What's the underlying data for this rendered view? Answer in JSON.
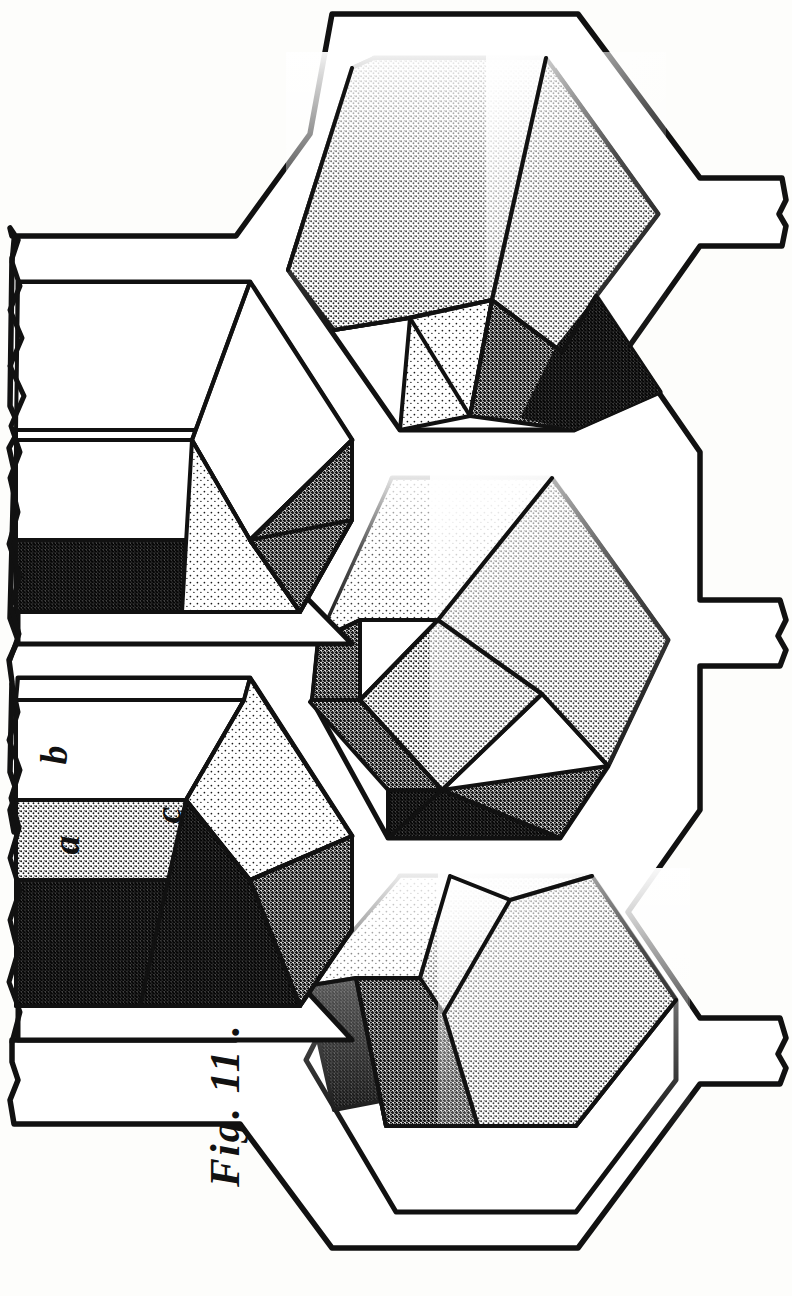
{
  "figure": {
    "caption": "Fig. 11 .",
    "plate_width": 792,
    "plate_height": 1296,
    "background_color": "#fdfdfb",
    "ink_color": "#111111"
  },
  "labels": [
    {
      "id": "a",
      "text": "a",
      "x": 56,
      "y": 826,
      "description": "lower-left cell wall, shaded band"
    },
    {
      "id": "b",
      "text": "b",
      "x": 44,
      "y": 736,
      "description": "lower-left cell wall, upper blank band"
    },
    {
      "id": "c",
      "text": "c",
      "x": 160,
      "y": 796,
      "description": "lower-left cell rhombic base facet"
    }
  ],
  "cells": [
    {
      "id": "cell-top-right",
      "name": "upper right hexagonal cell",
      "shading": "stippled",
      "visible_facets": 3
    },
    {
      "id": "cell-middle-right",
      "name": "middle right hexagonal cell",
      "shading": "stippled",
      "visible_facets": 3
    },
    {
      "id": "cell-bottom-right",
      "name": "lower right hexagonal cell",
      "shading": "stippled",
      "visible_facets": 3
    },
    {
      "id": "cell-upper-left",
      "name": "upper left sectioned cell",
      "shading": "part-stippled",
      "visible_facets": 3
    },
    {
      "id": "cell-lower-left",
      "name": "lower left sectioned cell",
      "shading": "part-stippled",
      "visible_facets": 3
    }
  ],
  "shading_levels": {
    "light": "#e9e9e4",
    "medium": "#b9b9b0",
    "dark": "#6e6e63",
    "darkest": "#3a3a33"
  },
  "notes": {
    "break_edge": "ragged torn edge at left of comb",
    "wall_stubs": "three short wall stubs project to the right"
  }
}
